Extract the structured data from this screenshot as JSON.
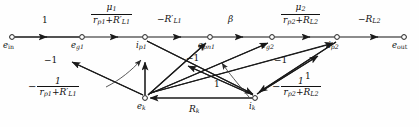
{
  "figure": {
    "type": "signal-flow-graph",
    "title": "",
    "background_color": "#fefefe",
    "line_color": "#1a1a1a"
  },
  "nodes": [
    {
      "id": "e_in",
      "base": "e",
      "sub": "in",
      "x": 12,
      "y": 37,
      "label_dx": -9,
      "label_dy": 5
    },
    {
      "id": "e_g1",
      "base": "e",
      "sub": "g1",
      "x": 82,
      "y": 37,
      "label_dx": -11,
      "label_dy": 5
    },
    {
      "id": "i_p1",
      "base": "i",
      "sub": "p1",
      "x": 145,
      "y": 37,
      "label_dx": -9,
      "label_dy": 5
    },
    {
      "id": "e_pn1",
      "base": "e",
      "sub": "pn1",
      "x": 210,
      "y": 37,
      "label_dx": -12,
      "label_dy": 5
    },
    {
      "id": "e_g2",
      "base": "e",
      "sub": "g2",
      "x": 272,
      "y": 37,
      "label_dx": -11,
      "label_dy": 5
    },
    {
      "id": "i_p2",
      "base": "i",
      "sub": "p2",
      "x": 337,
      "y": 37,
      "label_dx": -9,
      "label_dy": 5
    },
    {
      "id": "e_out",
      "base": "e",
      "sub": "out",
      "x": 404,
      "y": 37,
      "label_dx": -11,
      "label_dy": 5
    },
    {
      "id": "e_k",
      "base": "e",
      "sub": "k",
      "x": 145,
      "y": 98,
      "label_dx": -8,
      "label_dy": 5
    },
    {
      "id": "i_k",
      "base": "i",
      "sub": "k",
      "x": 255,
      "y": 98,
      "label_dx": -6,
      "label_dy": 5
    }
  ],
  "edges": [
    {
      "id": "edge-ein-eg1",
      "from": "e_in",
      "to": "e_g1",
      "label": "1"
    },
    {
      "id": "edge-eg1-ip1",
      "from": "e_g1",
      "to": "i_p1",
      "label": "mu1-over-rp1-RL1"
    },
    {
      "id": "edge-ip1-epn1",
      "from": "i_p1",
      "to": "e_pn1",
      "label": "-R'_L1"
    },
    {
      "id": "edge-epn1-eg2",
      "from": "e_pn1",
      "to": "e_g2",
      "label": "beta"
    },
    {
      "id": "edge-eg2-ip2",
      "from": "e_g2",
      "to": "i_p2",
      "label": "mu2-over-rp2-RL2"
    },
    {
      "id": "edge-ip2-eout",
      "from": "i_p2",
      "to": "e_out",
      "label": "-R_L2"
    },
    {
      "id": "edge-ek-eg1",
      "from": "e_k",
      "to": "e_g1",
      "label": "-1"
    },
    {
      "id": "edge-ek-ip1",
      "from": "e_k",
      "to": "i_p1",
      "label": "-1-over-rp1-RL1"
    },
    {
      "id": "edge-ek-epn1",
      "from": "e_k",
      "to": "e_pn1",
      "label": "-1"
    },
    {
      "id": "edge-ik-eg2",
      "from": "i_k",
      "to": "e_g2",
      "label": "-1"
    },
    {
      "id": "edge-ik-ip2",
      "from": "i_k",
      "to": "i_p2",
      "label": "-1-over-rp2-RL2"
    },
    {
      "id": "edge-ip1-ik",
      "from": "i_p1",
      "to": "i_k",
      "label": "1"
    },
    {
      "id": "edge-ip2-ek",
      "from": "i_p2",
      "to": "e_k",
      "label": "1"
    },
    {
      "id": "edge-ik-ek",
      "from": "i_k",
      "to": "e_k",
      "label": "R_k"
    },
    {
      "id": "edge-ek-ik-curve",
      "from": "e_k",
      "to": "i_k",
      "label": ""
    }
  ],
  "labels": {
    "gain_unity_in": "1",
    "gain_mu1": {
      "num_mu": "μ",
      "num_sub": "1",
      "den_r": "r",
      "den_r_sub": "p1",
      "den_plus": "+",
      "den_R": "R",
      "den_R_sub": "L1",
      "den_prime": "′"
    },
    "gain_negRL1": {
      "sign": "−",
      "R": "R",
      "sub": "L1",
      "prime": "′"
    },
    "gain_beta": "β",
    "gain_mu2": {
      "num_mu": "μ",
      "num_sub": "2",
      "den_r": "r",
      "den_r_sub": "p2",
      "den_plus": "+",
      "den_R": "R",
      "den_R_sub": "L2"
    },
    "gain_negRL2": {
      "sign": "−",
      "R": "R",
      "sub": "L2"
    },
    "gain_neg1_a": "−1",
    "gain_neg1_b": "−1",
    "gain_neg1_c": "−1",
    "gain_one_a": "1",
    "gain_one_b": "1",
    "gain_neg_inv_1": {
      "sign": "−",
      "num": "1",
      "den_r": "r",
      "den_r_sub": "p1",
      "den_plus": "+",
      "den_R": "R",
      "den_R_sub": "L1",
      "den_prime": "′"
    },
    "gain_neg_inv_2": {
      "sign": "−",
      "num": "1",
      "den_r": "r",
      "den_r_sub": "p2",
      "den_plus": "+",
      "den_R": "R",
      "den_R_sub": "L2"
    },
    "gain_Rk": {
      "R": "R",
      "sub": "k"
    }
  },
  "edge_label_positions": [
    {
      "id": "lbl-unity-in",
      "x": 43,
      "y": 16,
      "kind": "plain",
      "text": "1"
    },
    {
      "id": "lbl-negRL1",
      "x": 163,
      "y": 15,
      "kind": "plain",
      "text": "−R′L1"
    },
    {
      "id": "lbl-beta",
      "x": 229,
      "y": 16,
      "kind": "plain",
      "text": "β"
    },
    {
      "id": "lbl-negRL2",
      "x": 364,
      "y": 15,
      "kind": "plain",
      "text": "−RL2"
    },
    {
      "id": "lbl-neg1-a",
      "x": 45,
      "y": 57,
      "kind": "plain",
      "text": "−1"
    },
    {
      "id": "lbl-neg1-b",
      "x": 191,
      "y": 55,
      "kind": "plain",
      "text": "−1"
    },
    {
      "id": "lbl-neg1-c",
      "x": 277,
      "y": 57,
      "kind": "plain",
      "text": "−1"
    },
    {
      "id": "lbl-one-a",
      "x": 216,
      "y": 82,
      "kind": "plain",
      "text": "1"
    },
    {
      "id": "lbl-one-b",
      "x": 307,
      "y": 74,
      "kind": "plain",
      "text": "1"
    },
    {
      "id": "lbl-Rk",
      "x": 192,
      "y": 108,
      "kind": "plain",
      "text": "Rk"
    }
  ]
}
